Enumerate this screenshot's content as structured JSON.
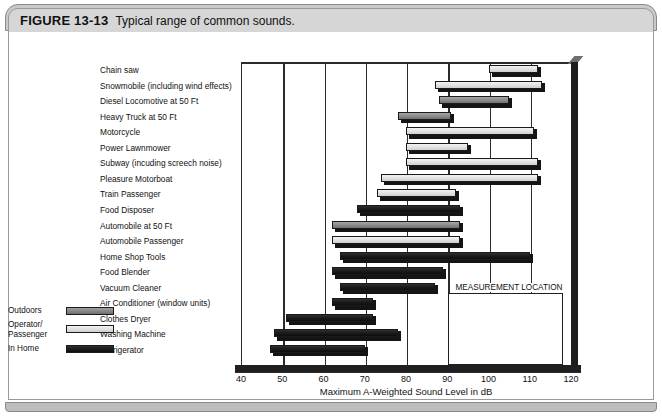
{
  "figure": {
    "label": "FIGURE 13-13",
    "title": "Typical range of common sounds."
  },
  "chart_data": {
    "type": "bar",
    "orientation": "horizontal-range",
    "title": "Typical range of common sounds.",
    "xlabel": "Maximum A-Weighted Sound Level in dB",
    "ylabel": "",
    "xlim": [
      40,
      120
    ],
    "xticks": [
      40,
      50,
      60,
      70,
      80,
      90,
      100,
      110,
      120
    ],
    "grid": true,
    "legend_title": "MEASUREMENT LOCATION",
    "legend_position": "inside-bottom-right",
    "series": [
      {
        "name": "Outdoors",
        "key": "outdoors",
        "color": "#8f8f8f"
      },
      {
        "name": "Operator/",
        "name2": "Passenger",
        "key": "operator",
        "color": "#e3e3e3"
      },
      {
        "name": "In Home",
        "key": "inhome",
        "color": "#1b1b1b"
      }
    ],
    "categories": [
      "Chain saw",
      "Snowmobile (including wind effects)",
      "Diesel Locomotive at 50 Ft",
      "Heavy Truck at 50 Ft",
      "Motorcycle",
      "Power Lawnmower",
      "Subway (incuding screech noise)",
      "Pleasure Motorboat",
      "Train Passenger",
      "Food Disposer",
      "Automobile at 50 Ft",
      "Automobile Passenger",
      "Home Shop Tools",
      "Food Blender",
      "Vacuum Cleaner",
      "Air Conditioner (window units)",
      "Clothes Dryer",
      "Washing Machine",
      "Refrigerator"
    ],
    "bars": [
      {
        "label": "Chain saw",
        "start": 100,
        "end": 112,
        "series": "operator"
      },
      {
        "label": "Snowmobile (including wind effects)",
        "start": 87,
        "end": 113,
        "series": "operator"
      },
      {
        "label": "Diesel Locomotive at 50 Ft",
        "start": 88,
        "end": 105,
        "series": "outdoors"
      },
      {
        "label": "Heavy Truck at 50 Ft",
        "start": 78,
        "end": 91,
        "series": "outdoors"
      },
      {
        "label": "Motorcycle",
        "start": 80,
        "end": 111,
        "series": "operator"
      },
      {
        "label": "Power Lawnmower",
        "start": 80,
        "end": 95,
        "series": "operator"
      },
      {
        "label": "Subway (incuding screech noise)",
        "start": 80,
        "end": 112,
        "series": "operator"
      },
      {
        "label": "Pleasure Motorboat",
        "start": 74,
        "end": 112,
        "series": "operator"
      },
      {
        "label": "Train Passenger",
        "start": 73,
        "end": 92,
        "series": "operator"
      },
      {
        "label": "Food Disposer",
        "start": 68,
        "end": 93,
        "series": "inhome"
      },
      {
        "label": "Automobile at 50 Ft",
        "start": 62,
        "end": 93,
        "series": "outdoors"
      },
      {
        "label": "Automobile Passenger",
        "start": 62,
        "end": 93,
        "series": "operator"
      },
      {
        "label": "Home Shop Tools",
        "start": 64,
        "end": 110,
        "series": "inhome"
      },
      {
        "label": "Food Blender",
        "start": 62,
        "end": 89,
        "series": "inhome"
      },
      {
        "label": "Vacuum Cleaner",
        "start": 64,
        "end": 87,
        "series": "inhome"
      },
      {
        "label": "Air Conditioner (window units)",
        "start": 62,
        "end": 72,
        "series": "inhome"
      },
      {
        "label": "Clothes Dryer",
        "start": 51,
        "end": 72,
        "series": "inhome"
      },
      {
        "label": "Washing Machine",
        "start": 48,
        "end": 78,
        "series": "inhome"
      },
      {
        "label": "Refrigerator",
        "start": 47,
        "end": 70,
        "series": "inhome"
      }
    ]
  }
}
